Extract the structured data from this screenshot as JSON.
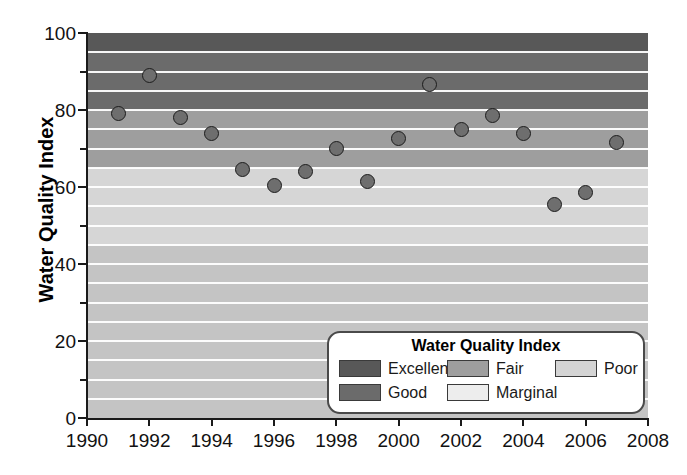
{
  "chart_data": {
    "type": "scatter",
    "title": "",
    "xlabel": "",
    "ylabel": "Water Quality Index",
    "xlim": [
      1990,
      2008
    ],
    "ylim": [
      0,
      100
    ],
    "grid": true,
    "x_ticks": [
      1990,
      1992,
      1994,
      1996,
      1998,
      2000,
      2002,
      2004,
      2006,
      2008
    ],
    "x_tick_labels": [
      "1990",
      "1992",
      "1994",
      "1996",
      "1998",
      "2000",
      "2002",
      "2004",
      "2006",
      "2008"
    ],
    "x_minor_ticks": [
      1991,
      1993,
      1995,
      1997,
      1999,
      2001,
      2003,
      2005,
      2007
    ],
    "y_ticks": [
      0,
      20,
      40,
      60,
      80,
      100
    ],
    "y_tick_labels": [
      "0",
      "20",
      "40",
      "60",
      "80",
      "100"
    ],
    "y_minor_ticks": [
      10,
      30,
      50,
      70,
      90
    ],
    "gridline_interval": 5,
    "marker": {
      "shape": "circle",
      "fill": "#6e6e6e",
      "edge": "#1c1c1c",
      "size_px": 15
    },
    "x": [
      1991,
      1992,
      1993,
      1994,
      1995,
      1996,
      1997,
      1998,
      1999,
      2000,
      2001,
      2002,
      2003,
      2004,
      2005,
      2006,
      2007
    ],
    "values": [
      79,
      89,
      78,
      74,
      64.5,
      60.5,
      64,
      70,
      61.5,
      72.5,
      86.5,
      75,
      78.5,
      74,
      55.5,
      58.5,
      71.5
    ],
    "points": [
      {
        "year": 1991,
        "value": 79
      },
      {
        "year": 1992,
        "value": 89
      },
      {
        "year": 1993,
        "value": 78
      },
      {
        "year": 1994,
        "value": 74
      },
      {
        "year": 1995,
        "value": 64.5
      },
      {
        "year": 1996,
        "value": 60.5
      },
      {
        "year": 1997,
        "value": 64
      },
      {
        "year": 1998,
        "value": 70
      },
      {
        "year": 1999,
        "value": 61.5
      },
      {
        "year": 2000,
        "value": 72.5
      },
      {
        "year": 2001,
        "value": 86.5
      },
      {
        "year": 2002,
        "value": 75
      },
      {
        "year": 2003,
        "value": 78.5
      },
      {
        "year": 2004,
        "value": 74
      },
      {
        "year": 2005,
        "value": 55.5
      },
      {
        "year": 2006,
        "value": 58.5
      },
      {
        "year": 2007,
        "value": 71.5
      }
    ],
    "bands": [
      {
        "label": "Excellent",
        "min": 95,
        "max": 100,
        "color": "#585858"
      },
      {
        "label": "Good",
        "min": 80,
        "max": 95,
        "color": "#6b6b6b"
      },
      {
        "label": "Fair",
        "min": 65,
        "max": 80,
        "color": "#9e9e9e"
      },
      {
        "label": "Marginal",
        "min": 45,
        "max": 65,
        "color": "#d6d6d6"
      },
      {
        "label": "Poor",
        "min": 0,
        "max": 45,
        "color": "#c4c4c4"
      }
    ]
  },
  "legend": {
    "title": "Water Quality Index",
    "items": [
      {
        "label": "Excellent",
        "color": "#585858"
      },
      {
        "label": "Good",
        "color": "#6b6b6b"
      },
      {
        "label": "Fair",
        "color": "#9e9e9e"
      },
      {
        "label": "Marginal",
        "color": "#ededed"
      },
      {
        "label": "Poor",
        "color": "#d4d4d4"
      }
    ]
  }
}
